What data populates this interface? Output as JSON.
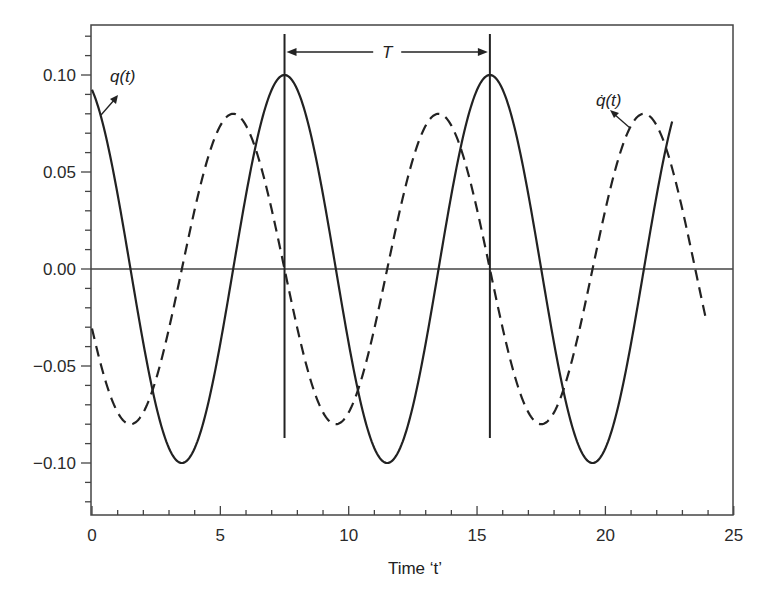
{
  "chart_data": {
    "type": "line",
    "title": "",
    "xlabel": "Time ‘t’",
    "ylabel": "",
    "xlim": [
      0,
      25
    ],
    "ylim": [
      -0.125,
      0.127
    ],
    "x_ticks": [
      0,
      5,
      10,
      15,
      20,
      25
    ],
    "x_tick_labels": [
      "0",
      "5",
      "10",
      "15",
      "20",
      "25"
    ],
    "x_minor_step": 1,
    "y_ticks": [
      0.1,
      0.05,
      0.0,
      -0.05,
      -0.1
    ],
    "y_tick_labels": [
      "0.10",
      "0.05",
      "0.00",
      "−0.05",
      "−0.10"
    ],
    "y_minor_step": 0.01,
    "grid": false,
    "zero_line": true,
    "series": [
      {
        "name": "q(t)",
        "style": "solid",
        "amplitude": 0.1,
        "period": 8,
        "peak_t": 7.5,
        "t_range": [
          0,
          22.6
        ],
        "x": [
          0,
          1.5,
          3.5,
          5.5,
          7.5,
          9.5,
          11.5,
          13.5,
          15.5,
          17.5,
          19.5,
          21.5,
          22.6
        ],
        "values": [
          0.092,
          0.0,
          -0.1,
          0.0,
          0.1,
          0.0,
          -0.1,
          0.0,
          0.1,
          0.0,
          -0.1,
          0.0,
          0.077
        ]
      },
      {
        "name": "q̇(t)",
        "style": "dashed",
        "amplitude": 0.08,
        "period": 8,
        "peak_t": 5.5,
        "t_range": [
          0,
          23.9
        ],
        "x": [
          0,
          1.5,
          3.5,
          5.5,
          7.5,
          9.5,
          11.5,
          13.5,
          15.5,
          17.5,
          19.5,
          21.5,
          23.5,
          23.9
        ],
        "values": [
          -0.031,
          -0.08,
          0.0,
          0.08,
          0.0,
          -0.08,
          0.0,
          0.08,
          0.0,
          -0.08,
          0.0,
          0.08,
          0.0,
          -0.025
        ]
      }
    ],
    "annotations": [
      {
        "text": "q(t)",
        "target": "solid curve",
        "x": 0.5,
        "y": 0.1
      },
      {
        "text": "q̇(t)",
        "target": "dashed curve",
        "x": 20.7,
        "y": 0.081
      },
      {
        "text": "T",
        "type": "period-arrow",
        "from_t": 7.5,
        "to_t": 15.5
      }
    ],
    "vertical_markers": [
      7.5,
      15.5
    ],
    "legend": null
  },
  "labels": {
    "q": "q(t)",
    "qdot": "q̇(t)",
    "period": "T",
    "xlabel": "Time ‘t’"
  }
}
